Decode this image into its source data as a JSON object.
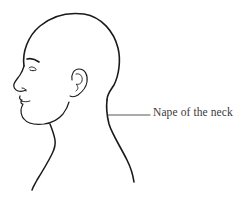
{
  "diagram": {
    "type": "anatomical-illustration",
    "labels": [
      {
        "text": "Nape of the neck",
        "target": "nape-of-neck"
      }
    ],
    "colors": {
      "line": "#1a1a1a",
      "leader": "#444444",
      "text": "#3a3a3a",
      "background": "#ffffff"
    }
  }
}
